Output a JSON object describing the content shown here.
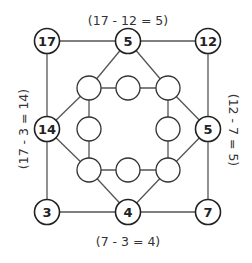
{
  "diagram": {
    "type": "magic-square-puzzle",
    "outer_nodes": {
      "top_left": "17",
      "top_middle": "5",
      "top_right": "12",
      "middle_left": "14",
      "middle_right": "5",
      "bottom_left": "3",
      "bottom_middle": "4",
      "bottom_right": "7"
    },
    "inner_nodes": {
      "count": 8,
      "values": [
        "",
        "",
        "",
        "",
        "",
        "",
        "",
        ""
      ]
    },
    "equations": {
      "top": "(17 - 12 = 5)",
      "left": "(17 - 3 = 14)",
      "right": "(12 - 7 = 5)",
      "bottom": "(7 - 3 = 4)"
    }
  }
}
